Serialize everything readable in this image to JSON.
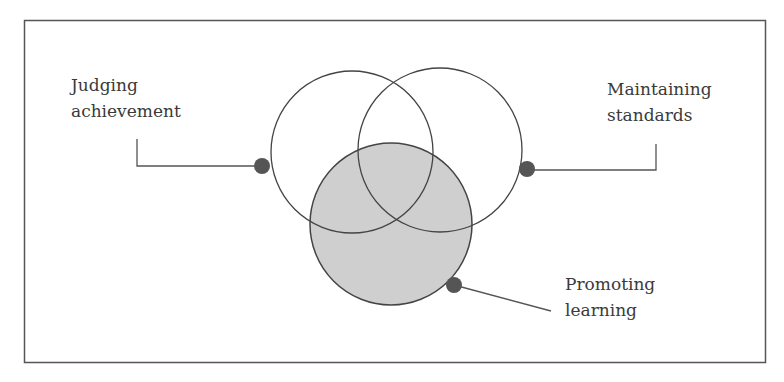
{
  "diagram": {
    "type": "venn",
    "colors": {
      "frame": "#555555",
      "circle_stroke": "#444444",
      "shaded_fill": "#cfcfcf",
      "dot_fill": "#555555",
      "text": "#3a3a3a",
      "background": "#ffffff"
    },
    "circles": [
      {
        "id": "judging",
        "cx": 352,
        "cy": 152,
        "r": 81,
        "shaded": false
      },
      {
        "id": "maintaining",
        "cx": 440,
        "cy": 150,
        "r": 82,
        "shaded": false
      },
      {
        "id": "promoting",
        "cx": 391,
        "cy": 224,
        "r": 81,
        "shaded": true
      }
    ],
    "labels": {
      "judging": {
        "line1": "Judging",
        "line2": "achievement"
      },
      "maintaining": {
        "line1": "Maintaining",
        "line2": "standards"
      },
      "promoting": {
        "line1": "Promoting",
        "line2": "learning"
      }
    }
  }
}
